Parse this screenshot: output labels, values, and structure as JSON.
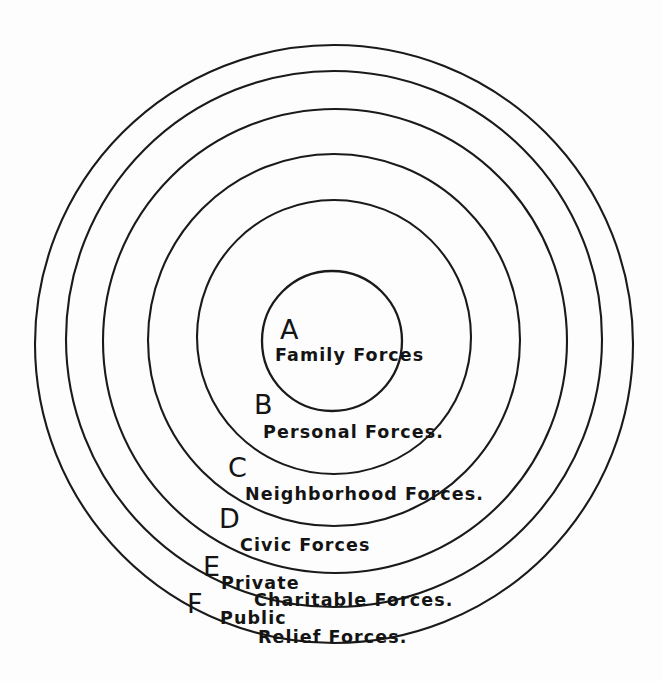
{
  "diagram": {
    "type": "concentric-rings",
    "background_color": "#fdfdfd",
    "stroke_color": "#1a1a1a",
    "center": {
      "x": 334,
      "y": 341
    },
    "rings": [
      {
        "key": "A",
        "letter": "A",
        "caption": "Family Forces",
        "caption_lines": [
          "Family Forces"
        ],
        "radius": 70,
        "cx": 332,
        "cy": 341,
        "order": 1
      },
      {
        "key": "B",
        "letter": "B",
        "caption": "Personal Forces.",
        "caption_lines": [
          "Personal Forces."
        ],
        "radius": 137,
        "cx": 334,
        "cy": 337,
        "order": 2
      },
      {
        "key": "C",
        "letter": "C",
        "caption": "Neighborhood Forces.",
        "caption_lines": [
          "Neighborhood Forces."
        ],
        "radius": 186,
        "cx": 334,
        "cy": 340,
        "order": 3
      },
      {
        "key": "D",
        "letter": "D",
        "caption": "Civic Forces",
        "caption_lines": [
          "Civic Forces"
        ],
        "radius": 232,
        "cx": 335,
        "cy": 341,
        "order": 4
      },
      {
        "key": "E",
        "letter": "E",
        "caption": "Private Charitable Forces.",
        "caption_lines": [
          "Private",
          "Charitable Forces."
        ],
        "radius": 268,
        "cx": 334,
        "cy": 339,
        "order": 5
      },
      {
        "key": "F",
        "letter": "F",
        "caption": "Public Relief Forces.",
        "caption_lines": [
          "Public",
          "Relief Forces."
        ],
        "radius": 299,
        "cx": 334,
        "cy": 344,
        "order": 6
      }
    ]
  }
}
